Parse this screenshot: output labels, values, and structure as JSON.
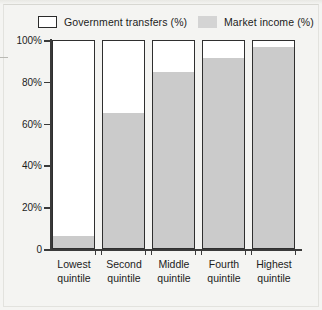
{
  "chart_data": {
    "type": "bar",
    "subtype": "stacked-100-percent",
    "title": "",
    "xlabel": "",
    "ylabel": "",
    "ylim": [
      0,
      100
    ],
    "ytick_labels": [
      "0",
      "20%",
      "40%",
      "60%",
      "80%",
      "100%"
    ],
    "ytick_values": [
      0,
      20,
      40,
      60,
      80,
      100
    ],
    "grid": false,
    "legend_position": "top",
    "categories": [
      "Lowest quintile",
      "Second quintile",
      "Middle quintile",
      "Fourth quintile",
      "Highest quintile"
    ],
    "category_lines": [
      [
        "Lowest",
        "quintile"
      ],
      [
        "Second",
        "quintile"
      ],
      [
        "Middle",
        "quintile"
      ],
      [
        "Fourth",
        "quintile"
      ],
      [
        "Highest",
        "quintile"
      ]
    ],
    "series": [
      {
        "name": "Market income (%)",
        "color": "#cbcbcb",
        "values": [
          6,
          65,
          85,
          92,
          97
        ]
      },
      {
        "name": "Government transfers (%)",
        "color": "#ffffff",
        "values": [
          94,
          35,
          15,
          8,
          3
        ]
      }
    ]
  },
  "legend": {
    "items": [
      {
        "label": "Government transfers (%)",
        "color": "#ffffff"
      },
      {
        "label": "Market income (%)",
        "color": "#d4d4d4"
      }
    ]
  },
  "axis": {
    "y_labels": [
      "100%",
      "80%",
      "60%",
      "40%",
      "20%",
      "0"
    ]
  },
  "colors": {
    "market_income": "#cbcbcb",
    "government_transfers": "#ffffff",
    "axis": "#3a3a3a",
    "bar_outline": "#2f2f2f",
    "background": "#f4f4f2",
    "text": "#1c1c1c"
  }
}
